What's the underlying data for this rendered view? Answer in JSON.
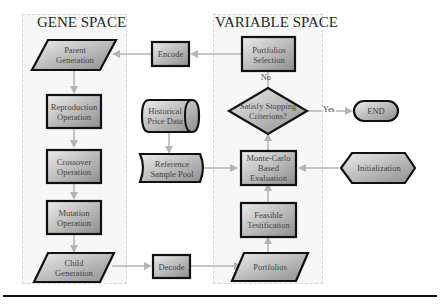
{
  "panels": {
    "gene_space": {
      "title": "GENE SPACE"
    },
    "variable_space": {
      "title": "VARIABLE SPACE"
    }
  },
  "nodes": {
    "parent_generation": {
      "label": "Parent Generation",
      "shape": "parallelogram"
    },
    "reproduction_operation": {
      "label": "Reproduction Operation",
      "shape": "rectangle"
    },
    "crossover_operation": {
      "label": "Crossover Operation",
      "shape": "rectangle"
    },
    "mutation_operation": {
      "label": "Mutation Operation",
      "shape": "rectangle"
    },
    "child_generation": {
      "label": "Child Generation",
      "shape": "parallelogram"
    },
    "encode": {
      "label": "Encode",
      "shape": "rectangle"
    },
    "decode": {
      "label": "Decode",
      "shape": "rectangle"
    },
    "historical_price_data": {
      "label": "Historical Price Data",
      "shape": "cylinder"
    },
    "reference_sample_pool": {
      "label": "Reference Sample Pool",
      "shape": "stored-data"
    },
    "portfolios_selection": {
      "label": "Portfolios Selection",
      "shape": "rectangle"
    },
    "satisfy_stopping": {
      "label": "Satisfy Stopping Criterions?",
      "shape": "diamond"
    },
    "end": {
      "label": "END",
      "shape": "terminator"
    },
    "monte_carlo": {
      "label": "Monte-Carlo Based Evaluation",
      "shape": "rectangle"
    },
    "initialization": {
      "label": "Initialization",
      "shape": "hexagon"
    },
    "feasible_testification": {
      "label": "Feasible Testification",
      "shape": "rectangle"
    },
    "portfolios": {
      "label": "Portfolios",
      "shape": "parallelogram"
    }
  },
  "edges": {
    "no_label": "No",
    "yes_label": "Yes"
  },
  "colors": {
    "fill_light": "#e4e4e4",
    "fill_dark": "#9a9a9a",
    "stroke": "#111111",
    "arrow": "#b4b4b4",
    "panel_bg": "#f7f7f7"
  }
}
